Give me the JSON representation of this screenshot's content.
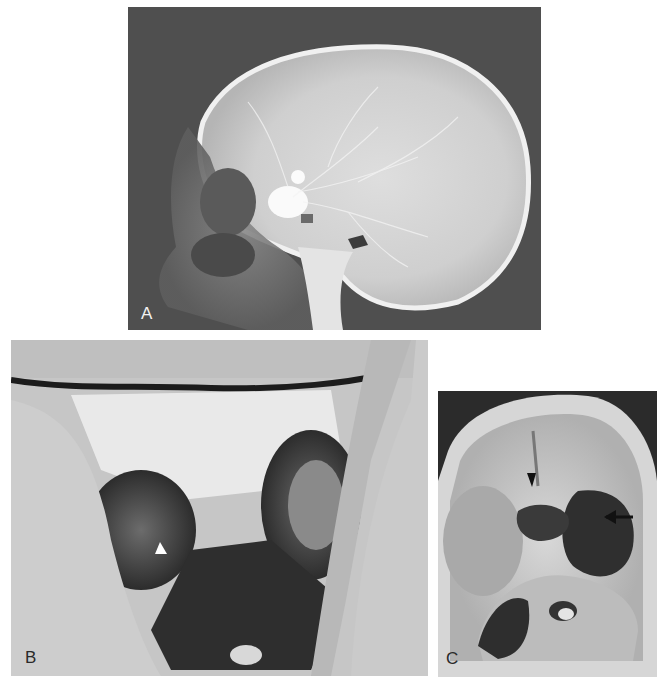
{
  "figure": {
    "panels": [
      {
        "id": "A",
        "label": "A",
        "content": "lateral skull angiogram (x-ray)",
        "colors": {
          "background": "#4e4e4e",
          "bone": "#e8e8e8",
          "label": "#f2f2f2"
        }
      },
      {
        "id": "B",
        "label": "B",
        "content": "intraoperative / autopsy photograph with white arrowhead",
        "annotations": [
          {
            "type": "arrowhead",
            "color": "#ffffff",
            "direction": "up"
          }
        ],
        "colors": {
          "background": "#c9c9c9",
          "dark": "#2e2e2e",
          "label": "#2a2a2a"
        }
      },
      {
        "id": "C",
        "label": "C",
        "content": "skull base specimen photograph with black arrowhead and arrow",
        "annotations": [
          {
            "type": "arrowhead",
            "color": "#111111",
            "direction": "down"
          },
          {
            "type": "arrow",
            "color": "#111111",
            "direction": "left"
          }
        ],
        "colors": {
          "background": "#cfcfcf",
          "dark": "#2a2a2a",
          "label": "#2a2a2a"
        }
      }
    ]
  }
}
